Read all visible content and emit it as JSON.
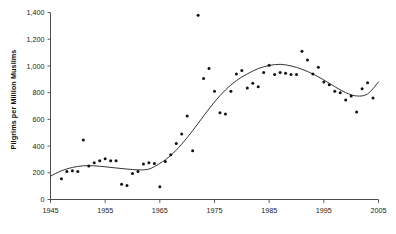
{
  "chart_data": {
    "type": "scatter",
    "title": "",
    "subtitle": "",
    "xlabel": "",
    "ylabel": "Pilgrims per Million Muslims",
    "xlim": [
      1945,
      2005
    ],
    "ylim": [
      0,
      1400
    ],
    "xticks": [
      1945,
      1955,
      1965,
      1975,
      1985,
      1995,
      2005
    ],
    "xticklabels": [
      "1945",
      "1955",
      "1965",
      "1975",
      "1985",
      "1995",
      "2005"
    ],
    "yticks": [
      0,
      200,
      400,
      600,
      800,
      1000,
      1200,
      1400
    ],
    "yticklabels": [
      "0",
      "200",
      "400",
      "600",
      "800",
      "1,000",
      "1,200",
      "1,400"
    ],
    "grid": false,
    "legend": null,
    "marker": "filled-circle",
    "marker_color": "#111111",
    "trendline_color": "#2b2b2b",
    "series": [
      {
        "name": "Pilgrims per Million Muslims",
        "x": [
          1947,
          1948,
          1949,
          1950,
          1951,
          1952,
          1953,
          1954,
          1955,
          1956,
          1957,
          1958,
          1959,
          1960,
          1961,
          1962,
          1963,
          1964,
          1965,
          1966,
          1967,
          1968,
          1969,
          1970,
          1971,
          1972,
          1973,
          1974,
          1975,
          1976,
          1977,
          1978,
          1979,
          1980,
          1981,
          1982,
          1983,
          1984,
          1985,
          1986,
          1987,
          1988,
          1989,
          1990,
          1991,
          1992,
          1993,
          1994,
          1995,
          1996,
          1997,
          1998,
          1999,
          2000,
          2001,
          2002,
          2003,
          2004
        ],
        "y": [
          155,
          210,
          215,
          210,
          445,
          250,
          275,
          290,
          305,
          290,
          290,
          115,
          105,
          195,
          210,
          265,
          275,
          270,
          95,
          285,
          335,
          420,
          490,
          625,
          365,
          1380,
          905,
          980,
          810,
          650,
          640,
          810,
          940,
          965,
          835,
          870,
          845,
          950,
          1005,
          935,
          950,
          945,
          935,
          935,
          1110,
          1045,
          940,
          990,
          880,
          860,
          810,
          800,
          745,
          775,
          655,
          830,
          875,
          760
        ]
      }
    ],
    "trendline": {
      "type": "loess-smooth",
      "description": "Smoothed fit rising from ~180 in 1945 to a plateau near 1,010 around 1986, then declining to ~770 by 2001 and rising to ~880 by 2005",
      "points": [
        [
          1945,
          175
        ],
        [
          1947,
          215
        ],
        [
          1949,
          240
        ],
        [
          1951,
          252
        ],
        [
          1953,
          252
        ],
        [
          1955,
          245
        ],
        [
          1957,
          236
        ],
        [
          1959,
          228
        ],
        [
          1961,
          222
        ],
        [
          1963,
          228
        ],
        [
          1965,
          270
        ],
        [
          1967,
          330
        ],
        [
          1969,
          415
        ],
        [
          1971,
          515
        ],
        [
          1973,
          625
        ],
        [
          1975,
          730
        ],
        [
          1977,
          820
        ],
        [
          1979,
          890
        ],
        [
          1981,
          940
        ],
        [
          1983,
          980
        ],
        [
          1985,
          1003
        ],
        [
          1987,
          1012
        ],
        [
          1989,
          1000
        ],
        [
          1991,
          975
        ],
        [
          1993,
          940
        ],
        [
          1995,
          895
        ],
        [
          1997,
          845
        ],
        [
          1999,
          800
        ],
        [
          2001,
          775
        ],
        [
          2003,
          790
        ],
        [
          2005,
          880
        ]
      ]
    }
  },
  "axis": {
    "y_title": "Pilgrims per Million Muslims"
  }
}
